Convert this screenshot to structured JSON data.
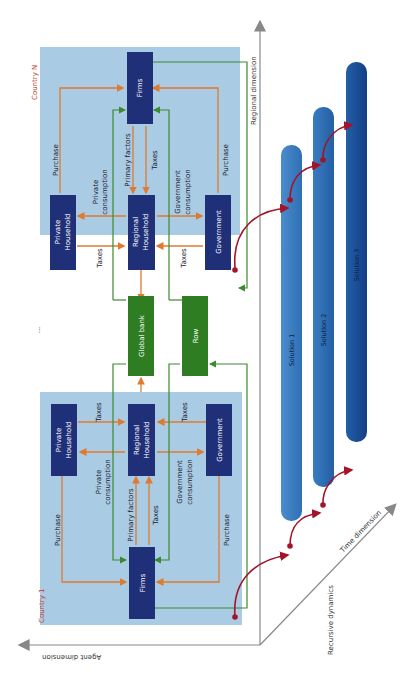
{
  "colors": {
    "panel_bg": "#a9cbe3",
    "agent_box": "#1f2f78",
    "global_box": "#2e7d22",
    "orange_arrow": "#e07a2e",
    "green_line": "#3b8a2e",
    "red_arrow": "#a3132a",
    "axis": "#888888",
    "solution_1": "#3a7cc0",
    "solution_2": "#2a6ab0",
    "solution_3": "#174e98"
  },
  "axes": {
    "regional": "Regional dimension",
    "agent": "Agent dimension",
    "time": "Time dimension",
    "recursive": "Recursive dynamics"
  },
  "countries": {
    "top": {
      "name": "Country N",
      "boxes": {
        "firms": "Firms",
        "private_household": "Private Household",
        "regional_household": "Regional Household",
        "government": "Government"
      },
      "labels": {
        "purchase_left": "Purchase",
        "purchase_right": "Purchase",
        "primary_factors": "Primary factors",
        "taxes_center": "Taxes",
        "private_consumption": "Private consumption",
        "government_consumption": "Government consumption",
        "taxes_left": "Taxes",
        "taxes_right": "Taxes"
      }
    },
    "bottom": {
      "name": "Country 1",
      "boxes": {
        "firms": "Firms",
        "private_household": "Private Household",
        "regional_household": "Regional Household",
        "government": "Government"
      },
      "labels": {
        "purchase_left": "Purchase",
        "purchase_right": "Purchase",
        "primary_factors": "Primary factors",
        "taxes_center": "Taxes",
        "private_consumption": "Private consumption",
        "government_consumption": "Government consumption",
        "taxes_left": "Taxes",
        "taxes_right": "Taxes"
      }
    }
  },
  "middle": {
    "ellipsis": "...",
    "global_bank": "Global bank",
    "row": "Row"
  },
  "solutions": [
    "Solution 1",
    "Solution 2",
    "Solution 3"
  ]
}
